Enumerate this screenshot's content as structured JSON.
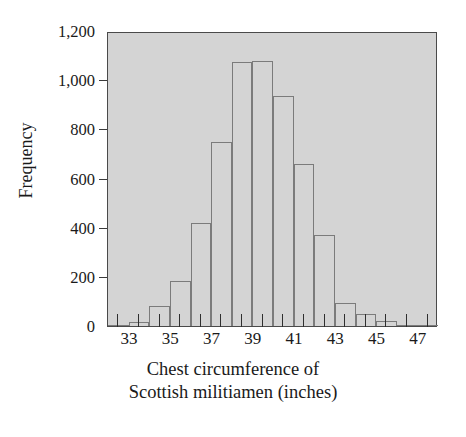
{
  "chart_data": {
    "type": "bar",
    "title": "",
    "subtitle": "",
    "xlabel_line1": "Chest circumference of",
    "xlabel_line2": "Scottish militiamen (inches)",
    "ylabel": "Frequency",
    "grid": false,
    "legend": "none",
    "xlim": [
      32,
      48
    ],
    "ylim": [
      0,
      1200
    ],
    "bin_width": 1,
    "categories": [
      "32",
      "33",
      "34",
      "35",
      "36",
      "37",
      "38",
      "39",
      "40",
      "41",
      "42",
      "43",
      "44",
      "45",
      "46",
      "47"
    ],
    "x": [
      32,
      33,
      34,
      35,
      36,
      37,
      38,
      39,
      40,
      41,
      42,
      43,
      44,
      45,
      46,
      47
    ],
    "values": [
      3,
      18,
      81,
      185,
      420,
      749,
      1073,
      1079,
      934,
      658,
      370,
      92,
      50,
      21,
      4,
      1
    ],
    "xticks": [
      33,
      35,
      37,
      39,
      41,
      43,
      45,
      47
    ],
    "xtick_labels": [
      "33",
      "35",
      "37",
      "39",
      "41",
      "43",
      "45",
      "47"
    ],
    "yticks": [
      0,
      200,
      400,
      600,
      800,
      1000,
      1200
    ],
    "ytick_labels": [
      "0",
      "200",
      "400",
      "600",
      "800",
      "1,000",
      "1,200"
    ],
    "colors": {
      "plot_background": "#d4d4d4",
      "bar_fill": "#d4d4d4",
      "bar_edge": "#7b7b7b",
      "frame": "#4a4a4a",
      "text": "#1a1a1a",
      "page_background": "#ffffff"
    }
  }
}
